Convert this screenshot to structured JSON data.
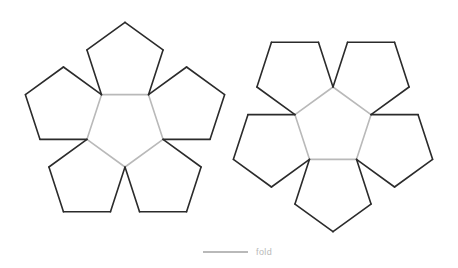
{
  "figure": {
    "name": "dodecahedron-net",
    "title": "",
    "background_color": "#ffffff",
    "cut_edge_color": "#2b2b2b",
    "fold_edge_color": "#b9b9b9",
    "face_fill": "#ffffff",
    "cut_stroke_width": 1.6,
    "fold_stroke_width": 1.6,
    "face_count": 12,
    "face_shape": "pentagon"
  },
  "legend": {
    "label": "fold",
    "swatch_color": "#b9b9b9",
    "swatch_x1": 203,
    "swatch_x2": 248,
    "swatch_y": 252,
    "text_x": 256,
    "text_y": 255
  },
  "geometry": {
    "circumradius": 40,
    "left_rosette": {
      "center_x": 125,
      "center_y": 127,
      "center_rotation_deg": 36,
      "petal_count": 5
    },
    "right_rosette": {
      "center_x": 333,
      "center_y": 127,
      "center_rotation_deg": 0,
      "petal_count": 5
    }
  },
  "chart_data": {
    "type": "diagram",
    "total_faces": 12,
    "faces_per_rosette": 6,
    "edge_types": [
      {
        "name": "cut",
        "color": "#2b2b2b",
        "count": 25
      },
      {
        "name": "fold",
        "color": "#b9b9b9",
        "count": 11
      }
    ]
  }
}
